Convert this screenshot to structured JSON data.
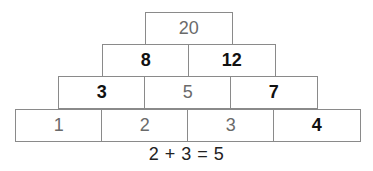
{
  "pyramid": {
    "rows": [
      {
        "cells": [
          {
            "value": "20",
            "style": "filled"
          }
        ]
      },
      {
        "cells": [
          {
            "value": "8",
            "style": "given"
          },
          {
            "value": "12",
            "style": "given"
          }
        ]
      },
      {
        "cells": [
          {
            "value": "3",
            "style": "given"
          },
          {
            "value": "5",
            "style": "filled"
          },
          {
            "value": "7",
            "style": "given"
          }
        ]
      },
      {
        "cells": [
          {
            "value": "1",
            "style": "filled"
          },
          {
            "value": "2",
            "style": "filled"
          },
          {
            "value": "3",
            "style": "filled"
          },
          {
            "value": "4",
            "style": "given"
          }
        ]
      }
    ],
    "caption": "2 + 3 = 5"
  },
  "colors": {
    "border": "#8a8a8a",
    "given_text": "#111111",
    "filled_text": "#6a6a6a"
  }
}
